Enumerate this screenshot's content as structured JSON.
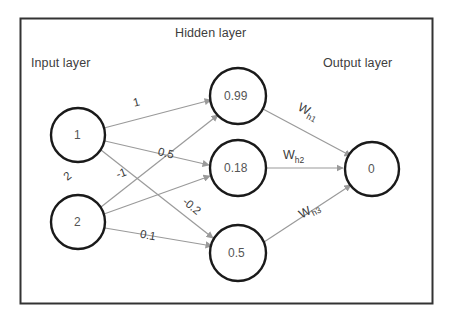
{
  "figure": {
    "type": "neural-network-diagram",
    "frame_color": "#333333",
    "node_stroke": "#1a1a1a",
    "edge_color": "#9a9a9a",
    "text_color": "#3d3d3d"
  },
  "captions": {
    "input": "Input layer",
    "hidden": "Hidden layer",
    "output": "Output layer"
  },
  "layers": {
    "input": {
      "nodes": [
        {
          "id": "i1",
          "label": "1",
          "cx": 78,
          "cy": 135,
          "r": 27
        },
        {
          "id": "i2",
          "label": "2",
          "cx": 78,
          "cy": 222,
          "r": 27
        }
      ]
    },
    "hidden": {
      "nodes": [
        {
          "id": "h1",
          "label": "0.99",
          "cx": 238,
          "cy": 96,
          "r": 28
        },
        {
          "id": "h2",
          "label": "0.18",
          "cx": 238,
          "cy": 168,
          "r": 28
        },
        {
          "id": "h3",
          "label": "0.5",
          "cx": 238,
          "cy": 253,
          "r": 28
        }
      ]
    },
    "output": {
      "nodes": [
        {
          "id": "o1",
          "label": "0",
          "cx": 372,
          "cy": 169,
          "r": 27
        }
      ]
    }
  },
  "edges": [
    {
      "id": "e-i1-h1",
      "from": "i1",
      "to": "h1",
      "weight": "1"
    },
    {
      "id": "e-i1-h2",
      "from": "i1",
      "to": "h2",
      "weight": "0.5"
    },
    {
      "id": "e-i1-h3",
      "from": "i1",
      "to": "h3",
      "weight": "-0.2"
    },
    {
      "id": "e-i2-h1",
      "from": "i2",
      "to": "h1",
      "weight": "2"
    },
    {
      "id": "e-i2-h2",
      "from": "i2",
      "to": "h2",
      "weight": "-1"
    },
    {
      "id": "e-i2-h3",
      "from": "i2",
      "to": "h3",
      "weight": "0.1"
    },
    {
      "id": "e-h1-o1",
      "from": "h1",
      "to": "o1",
      "weight_base": "W",
      "weight_sub": "h1"
    },
    {
      "id": "e-h2-o1",
      "from": "h2",
      "to": "o1",
      "weight_base": "W",
      "weight_sub": "h2"
    },
    {
      "id": "e-h3-o1",
      "from": "h3",
      "to": "o1",
      "weight_base": "W",
      "weight_sub": "h3"
    }
  ],
  "edge_labels": {
    "w_i1h1": "1",
    "w_i1h2": "0.5",
    "w_i1h3": "-0.2",
    "w_i2h1": "2",
    "w_i2h2": "-1",
    "w_i2h3": "0.1",
    "w_h1_base": "W",
    "w_h1_sub": "h1",
    "w_h2_base": "W",
    "w_h2_sub": "h2",
    "w_h3_base": "W",
    "w_h3_sub": "h3"
  }
}
